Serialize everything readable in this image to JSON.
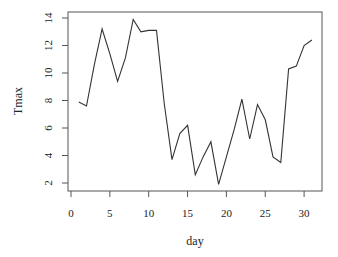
{
  "chart_data": {
    "type": "line",
    "title": "",
    "xlabel": "day",
    "ylabel": "Tmax",
    "xlim": [
      0,
      31
    ],
    "ylim": [
      1.9,
      13.9
    ],
    "x_ticks": [
      0,
      5,
      10,
      15,
      20,
      25,
      30
    ],
    "y_ticks": [
      2,
      4,
      6,
      8,
      10,
      12,
      14
    ],
    "grid": false,
    "legend": null,
    "series": [
      {
        "name": "Tmax",
        "x": [
          1,
          2,
          3,
          4,
          5,
          6,
          7,
          8,
          9,
          10,
          11,
          12,
          13,
          14,
          15,
          16,
          17,
          18,
          19,
          20,
          21,
          22,
          23,
          24,
          25,
          26,
          27,
          28,
          29,
          30,
          31
        ],
        "values": [
          7.9,
          7.6,
          10.6,
          13.2,
          11.4,
          9.4,
          11.1,
          13.9,
          13.0,
          13.1,
          13.1,
          7.8,
          3.7,
          5.6,
          6.2,
          2.6,
          3.9,
          5.0,
          1.9,
          3.9,
          5.9,
          8.1,
          5.2,
          7.7,
          6.6,
          3.9,
          3.5,
          10.3,
          10.5,
          12.0,
          12.4
        ]
      }
    ],
    "colors": {
      "line": "#333333",
      "axis": "#444444"
    }
  }
}
